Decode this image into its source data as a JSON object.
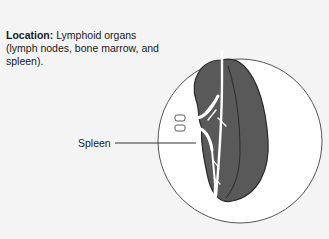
{
  "caption": {
    "heading": "Location:",
    "text": " Lymphoid organs (lymph nodes, bone marrow, and spleen)."
  },
  "labels": {
    "spleen": "Spleen"
  },
  "colors": {
    "background": "#f4f4f4",
    "organ_fill": "#595959",
    "organ_outline": "#2a2a2a",
    "vessel": "#ffffff",
    "circle_stroke": "#555555"
  }
}
